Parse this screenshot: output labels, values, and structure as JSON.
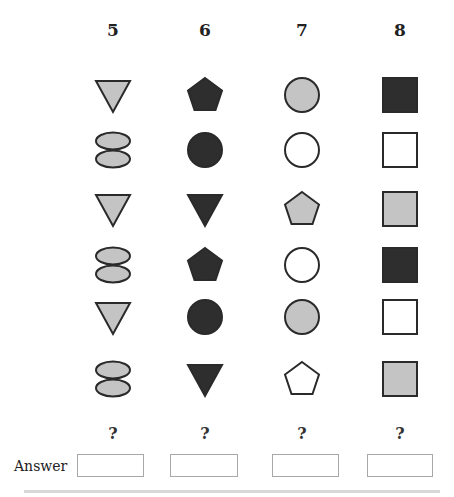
{
  "columns": [
    {
      "label": "5",
      "x": 113
    },
    {
      "label": "6",
      "x": 205
    },
    {
      "label": "7",
      "x": 302
    },
    {
      "label": "8",
      "x": 400
    }
  ],
  "colors": {
    "light": "#c4c4c4",
    "dark": "#2e2e2e",
    "white": "#ffffff",
    "stroke": "#2a2a2a"
  },
  "grid": [
    [
      {
        "shape": "triangle-down",
        "fill": "light"
      },
      {
        "shape": "pentagon",
        "fill": "dark"
      },
      {
        "shape": "circle",
        "fill": "light"
      },
      {
        "shape": "square",
        "fill": "dark"
      }
    ],
    [
      {
        "shape": "double-ellipse",
        "fill": "light"
      },
      {
        "shape": "circle",
        "fill": "dark"
      },
      {
        "shape": "circle",
        "fill": "white"
      },
      {
        "shape": "square",
        "fill": "white"
      }
    ],
    [
      {
        "shape": "triangle-down",
        "fill": "light"
      },
      {
        "shape": "triangle-down",
        "fill": "dark"
      },
      {
        "shape": "pentagon",
        "fill": "light"
      },
      {
        "shape": "square",
        "fill": "light"
      }
    ],
    [
      {
        "shape": "double-ellipse",
        "fill": "light"
      },
      {
        "shape": "pentagon",
        "fill": "dark"
      },
      {
        "shape": "circle",
        "fill": "white"
      },
      {
        "shape": "square",
        "fill": "dark"
      }
    ],
    [
      {
        "shape": "triangle-down",
        "fill": "light"
      },
      {
        "shape": "circle",
        "fill": "dark"
      },
      {
        "shape": "circle",
        "fill": "light"
      },
      {
        "shape": "square",
        "fill": "white"
      }
    ],
    [
      {
        "shape": "double-ellipse",
        "fill": "light"
      },
      {
        "shape": "triangle-down",
        "fill": "dark"
      },
      {
        "shape": "pentagon",
        "fill": "white"
      },
      {
        "shape": "square",
        "fill": "light"
      }
    ]
  ],
  "row_y": [
    95,
    150,
    209,
    265,
    317,
    379
  ],
  "question_marks": [
    "?",
    "?",
    "?",
    "?"
  ],
  "answer": {
    "label": "Answer",
    "boxes": [
      {
        "left": 77,
        "width": 67,
        "value": ""
      },
      {
        "left": 170,
        "width": 68,
        "value": ""
      },
      {
        "left": 272,
        "width": 67,
        "value": ""
      },
      {
        "left": 367,
        "width": 66,
        "value": ""
      }
    ]
  }
}
